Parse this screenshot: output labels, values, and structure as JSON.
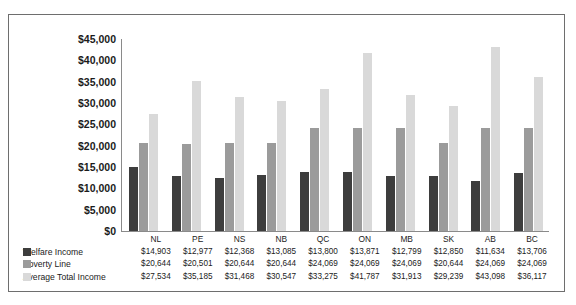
{
  "chart_data": {
    "type": "bar",
    "title": "",
    "xlabel": "",
    "ylabel": "",
    "ylim": [
      0,
      45000
    ],
    "grid": false,
    "legend_position": "bottom-left",
    "categories": [
      "NL",
      "PE",
      "NS",
      "NB",
      "QC",
      "ON",
      "MB",
      "SK",
      "AB",
      "BC"
    ],
    "yticks": [
      "$0",
      "$5,000",
      "$10,000",
      "$15,000",
      "$20,000",
      "$25,000",
      "$30,000",
      "$35,000",
      "$40,000",
      "$45,000"
    ],
    "ytick_values": [
      0,
      5000,
      10000,
      15000,
      20000,
      25000,
      30000,
      35000,
      40000,
      45000
    ],
    "series": [
      {
        "name": "Welfare Income",
        "color": "#3d3d3d",
        "values": [
          14903,
          12977,
          12368,
          13085,
          13800,
          13871,
          12799,
          12850,
          11634,
          13706
        ],
        "labels": [
          "$14,903",
          "$12,977",
          "$12,368",
          "$13,085",
          "$13,800",
          "$13,871",
          "$12,799",
          "$12,850",
          "$11,634",
          "$13,706"
        ]
      },
      {
        "name": "Poverty Line",
        "color": "#9b9b9b",
        "values": [
          20644,
          20501,
          20644,
          20644,
          24069,
          24069,
          24069,
          20644,
          24069,
          24069
        ],
        "labels": [
          "$20,644",
          "$20,501",
          "$20,644",
          "$20,644",
          "$24,069",
          "$24,069",
          "$24,069",
          "$20,644",
          "$24,069",
          "$24,069"
        ]
      },
      {
        "name": "Average Total Income",
        "color": "#d9d9d9",
        "values": [
          27534,
          35185,
          31468,
          30547,
          33275,
          41787,
          31913,
          29239,
          43098,
          36117
        ],
        "labels": [
          "$27,534",
          "$35,185",
          "$31,468",
          "$30,547",
          "$33,275",
          "$41,787",
          "$31,913",
          "$29,239",
          "$43,098",
          "$36,117"
        ]
      }
    ]
  }
}
